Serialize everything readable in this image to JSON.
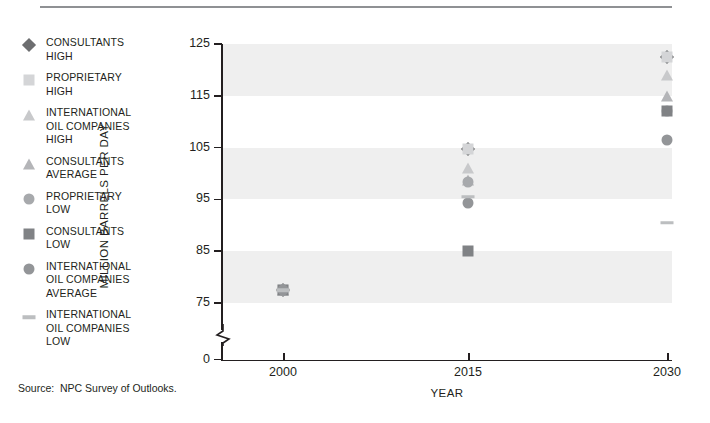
{
  "source_note": "Source:  NPC Survey of Outlooks.",
  "legend": {
    "items": [
      {
        "marker": "diamond",
        "color": "#6d6e70",
        "label": "CONSULTANTS\nHIGH"
      },
      {
        "marker": "square",
        "color": "#d4d5d7",
        "label": "PROPRIETARY\nHIGH"
      },
      {
        "marker": "triangle",
        "color": "#c8c9cb",
        "label": "INTERNATIONAL\nOIL COMPANIES\nHIGH"
      },
      {
        "marker": "triangle",
        "color": "#b4b5b8",
        "label": "CONSULTANTS\nAVERAGE"
      },
      {
        "marker": "circle",
        "color": "#a7a9ac",
        "label": "PROPRIETARY\nLOW"
      },
      {
        "marker": "square",
        "color": "#808285",
        "label": "CONSULTANTS\nLOW"
      },
      {
        "marker": "circle",
        "color": "#939598",
        "label": "INTERNATIONAL\nOIL COMPANIES\nAVERAGE"
      },
      {
        "marker": "dash",
        "color": "#bcbec0",
        "label": "INTERNATIONAL\nOIL COMPANIES\nLOW"
      }
    ]
  },
  "chart_data": {
    "type": "scatter",
    "title": "",
    "xlabel": "YEAR",
    "ylabel": "MILLION BARRELS PER DAY",
    "x_categories": [
      2000,
      2015,
      2030
    ],
    "x_ticks": [
      "2000",
      "2015",
      "2030"
    ],
    "y_ticks": [
      0,
      75,
      85,
      95,
      105,
      115,
      125
    ],
    "y_tick_labels": [
      "0",
      "75",
      "85",
      "95",
      "105",
      "115",
      "125"
    ],
    "ylim": [
      75,
      125
    ],
    "y_axis_break": true,
    "grid": false,
    "banded_background": true,
    "band_color": "#efefef",
    "bands": [
      [
        115,
        125
      ],
      [
        95,
        105
      ],
      [
        75,
        85
      ]
    ],
    "legend_position": "left-outside",
    "series": [
      {
        "name": "CONSULTANTS HIGH",
        "marker": "diamond",
        "color": "#6d6e70",
        "points": [
          {
            "x": 2000,
            "y": 77.5
          },
          {
            "x": 2015,
            "y": 104.7
          },
          {
            "x": 2030,
            "y": 122.5
          }
        ]
      },
      {
        "name": "PROPRIETARY HIGH",
        "marker": "square",
        "color": "#d4d5d7",
        "points": [
          {
            "x": 2000,
            "y": 77.5
          },
          {
            "x": 2015,
            "y": 104.7
          },
          {
            "x": 2030,
            "y": 122.5
          }
        ]
      },
      {
        "name": "INTERNATIONAL OIL COMPANIES HIGH",
        "marker": "triangle",
        "color": "#c8c9cb",
        "points": [
          {
            "x": 2000,
            "y": 77.5
          },
          {
            "x": 2015,
            "y": 101.0
          },
          {
            "x": 2030,
            "y": 119.0
          }
        ]
      },
      {
        "name": "CONSULTANTS AVERAGE",
        "marker": "triangle",
        "color": "#b4b5b8",
        "points": [
          {
            "x": 2000,
            "y": 77.5
          },
          {
            "x": 2015,
            "y": 98.8
          },
          {
            "x": 2030,
            "y": 115.0
          }
        ]
      },
      {
        "name": "PROPRIETARY LOW",
        "marker": "circle",
        "color": "#a7a9ac",
        "points": [
          {
            "x": 2000,
            "y": 77.5
          },
          {
            "x": 2015,
            "y": 98.3
          },
          {
            "x": 2030,
            "y": 112.0
          }
        ]
      },
      {
        "name": "CONSULTANTS LOW",
        "marker": "square",
        "color": "#808285",
        "points": [
          {
            "x": 2000,
            "y": 77.5
          },
          {
            "x": 2015,
            "y": 85.0
          },
          {
            "x": 2030,
            "y": 112.0
          }
        ]
      },
      {
        "name": "INTERNATIONAL OIL COMPANIES AVERAGE",
        "marker": "circle",
        "color": "#939598",
        "points": [
          {
            "x": 2000,
            "y": 77.5
          },
          {
            "x": 2015,
            "y": 94.3
          },
          {
            "x": 2030,
            "y": 106.5
          }
        ]
      },
      {
        "name": "INTERNATIONAL OIL COMPANIES LOW",
        "marker": "dash",
        "color": "#bcbec0",
        "points": [
          {
            "x": 2000,
            "y": 77.5
          },
          {
            "x": 2015,
            "y": 95.5
          },
          {
            "x": 2030,
            "y": 90.5
          }
        ]
      }
    ]
  }
}
